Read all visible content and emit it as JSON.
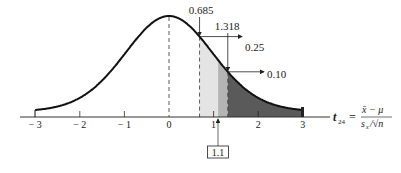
{
  "chart_data": {
    "type": "area",
    "title": "",
    "xlabel": "t24 = (x̄ − μ) / (s_x / √n)",
    "ylabel": "",
    "xlim": [
      -3,
      3
    ],
    "x_ticks": [
      "−3",
      "−2",
      "−1",
      "0",
      "1",
      "2",
      "3"
    ],
    "x_tick_values": [
      -3,
      -2,
      -1,
      0,
      1,
      2,
      3
    ],
    "grid": false,
    "legend": null,
    "annotations": [
      {
        "label": "0.685",
        "x": 0.685,
        "tail_area": "0.25"
      },
      {
        "label": "1.318",
        "x": 1.318,
        "tail_area": "0.10"
      },
      {
        "label": "1.1",
        "x": 1.1,
        "boxed": true
      }
    ],
    "shaded_regions": [
      {
        "from": 0.685,
        "to": 1.1,
        "shade": "light"
      },
      {
        "from": 1.1,
        "to": 1.318,
        "shade": "medium"
      },
      {
        "from": 1.318,
        "to": 3,
        "shade": "dark"
      }
    ],
    "mean_line": {
      "x": 0,
      "style": "dashed"
    }
  },
  "labels": {
    "t685": "0.685",
    "t1318": "1.318",
    "area25": "0.25",
    "area10": "0.10",
    "obs": "1.1",
    "axis_var": "t",
    "axis_sub": "24",
    "eq": "=",
    "num": "x̄ − μ",
    "den_s": "s",
    "den_sub": "x",
    "den_rest": "/√n",
    "ticks": [
      "− 3",
      "− 2",
      "− 1",
      "0",
      "1",
      "2",
      "3"
    ]
  },
  "colors": {
    "curve": "#111111",
    "light": "#e4e4e4",
    "medium": "#b4b4b4",
    "dark": "#5a5a5a",
    "axis": "#333333"
  }
}
